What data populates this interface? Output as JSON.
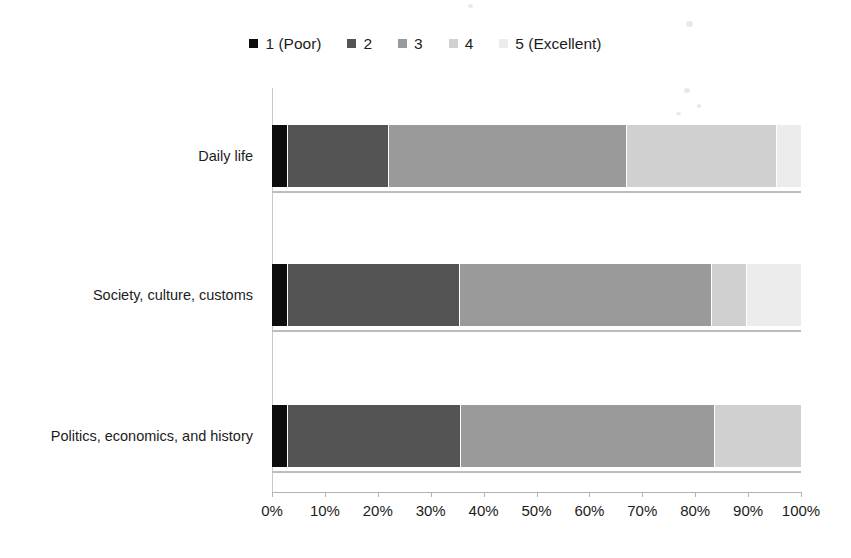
{
  "chart_data": {
    "type": "bar",
    "orientation": "horizontal",
    "stacked": true,
    "normalized_percent": true,
    "title": "",
    "subtitle": "",
    "xlabel": "",
    "ylabel": "",
    "xlim": [
      0,
      100
    ],
    "grid": false,
    "legend_position": "top-center",
    "categories": [
      "Daily life",
      "Society, culture, customs",
      "Politics, economics, and history"
    ],
    "x_tick_labels": [
      "0%",
      "10%",
      "20%",
      "30%",
      "40%",
      "50%",
      "60%",
      "70%",
      "80%",
      "90%",
      "100%"
    ],
    "x_tick_values": [
      0,
      10,
      20,
      30,
      40,
      50,
      60,
      70,
      80,
      90,
      100
    ],
    "series": [
      {
        "name": "1 (Poor)",
        "color": "#0d0d0d",
        "values": [
          3.0,
          3.0,
          3.0
        ]
      },
      {
        "name": "2",
        "color": "#545454",
        "values": [
          19.1,
          32.6,
          32.7
        ]
      },
      {
        "name": "3",
        "color": "#9a9a9a",
        "values": [
          45.0,
          47.6,
          48.0
        ]
      },
      {
        "name": "4",
        "color": "#d0d0d0",
        "values": [
          28.4,
          6.6,
          16.3
        ]
      },
      {
        "name": "5 (Excellent)",
        "color": "#ececec",
        "values": [
          4.5,
          10.2,
          0.0
        ]
      }
    ],
    "annotations": []
  },
  "legend": {
    "entries": [
      {
        "label": "1 (Poor)",
        "color": "#0d0d0d"
      },
      {
        "label": "2",
        "color": "#545454"
      },
      {
        "label": "3",
        "color": "#9a9a9a"
      },
      {
        "label": "4",
        "color": "#d0d0d0"
      },
      {
        "label": "5 (Excellent)",
        "color": "#ececec"
      }
    ]
  },
  "axis": {
    "x_ticks": [
      "0%",
      "10%",
      "20%",
      "30%",
      "40%",
      "50%",
      "60%",
      "70%",
      "80%",
      "90%",
      "100%"
    ],
    "y_categories": [
      "Daily life",
      "Society, culture, customs",
      "Politics, economics, and history"
    ]
  },
  "colors": {
    "axis_line": "#b3b3b3",
    "baseline": "#bdbdbd",
    "text": "#1c1c1c",
    "background": "#ffffff",
    "segment_divider": "#ffffff"
  }
}
